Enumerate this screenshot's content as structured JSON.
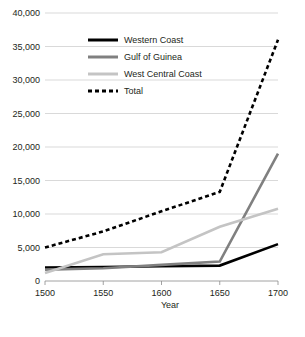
{
  "chart_data": {
    "type": "line",
    "title": "",
    "xlabel": "Year",
    "ylabel": "",
    "x": [
      1500,
      1550,
      1600,
      1650,
      1700
    ],
    "xticklabels": [
      "1500",
      "1550",
      "1600",
      "1650",
      "1700"
    ],
    "yticklabels": [
      "0",
      "5,000",
      "10,000",
      "15,000",
      "20,000",
      "25,000",
      "30,000",
      "35,000",
      "40,000"
    ],
    "yticks": [
      0,
      5000,
      10000,
      15000,
      20000,
      25000,
      30000,
      35000,
      40000
    ],
    "xlim": [
      1500,
      1700
    ],
    "ylim": [
      0,
      40000
    ],
    "grid": "horizontal",
    "legend_position": "upper-left-inside",
    "series": [
      {
        "name": "Western Coast",
        "values": [
          2000,
          2100,
          2200,
          2300,
          5500
        ],
        "color": "#000000",
        "style": "solid",
        "width": 2.6
      },
      {
        "name": "Gulf of Guinea",
        "values": [
          1700,
          1900,
          2400,
          2900,
          19000
        ],
        "color": "#808080",
        "style": "solid",
        "width": 2.6
      },
      {
        "name": "West Central Coast",
        "values": [
          1200,
          4000,
          4300,
          8100,
          10800
        ],
        "color": "#c4c4c4",
        "style": "solid",
        "width": 2.6
      },
      {
        "name": "Total",
        "values": [
          5000,
          7400,
          10400,
          13300,
          36000
        ],
        "color": "#000000",
        "style": "dashed",
        "width": 2.6
      }
    ]
  },
  "caption": ""
}
